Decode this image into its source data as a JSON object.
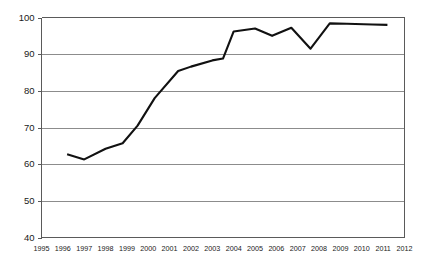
{
  "chart_data": {
    "type": "line",
    "title": "",
    "subtitle": "",
    "xlabel": "",
    "ylabel": "",
    "xlim": [
      1995,
      2012
    ],
    "ylim": [
      40,
      100
    ],
    "grid": true,
    "legend": false,
    "legend_position": "none",
    "background_color": "#ffffff",
    "line_color": "#111111",
    "grid_color": "#8c8c8c",
    "axis_color": "#5a5a5a",
    "x_tick_labels": [
      "1995",
      "1996",
      "1997",
      "1998",
      "1999",
      "2000",
      "2001",
      "2002",
      "2003",
      "2004",
      "2005",
      "2006",
      "2007",
      "2008",
      "2009",
      "2010",
      "2011",
      "2012"
    ],
    "y_tick_labels": [
      "40",
      "50",
      "60",
      "70",
      "80",
      "90",
      "100"
    ],
    "y_ticks": [
      40,
      50,
      60,
      70,
      80,
      90,
      100
    ],
    "series": [
      {
        "name": "series-1",
        "x": [
          1996.2,
          1997.0,
          1998.0,
          1998.8,
          1999.5,
          2000.3,
          2001.4,
          2002.0,
          2003.0,
          2003.5,
          2004.0,
          2005.0,
          2005.8,
          2006.7,
          2007.6,
          2008.5,
          2009.3,
          2010.5,
          2011.2
        ],
        "values": [
          62.7,
          61.3,
          64.2,
          65.7,
          70.5,
          78.0,
          85.4,
          86.6,
          88.3,
          88.8,
          96.2,
          97.0,
          95.0,
          97.2,
          91.5,
          98.4,
          98.3,
          98.1,
          98.0
        ]
      }
    ],
    "annotations": []
  }
}
